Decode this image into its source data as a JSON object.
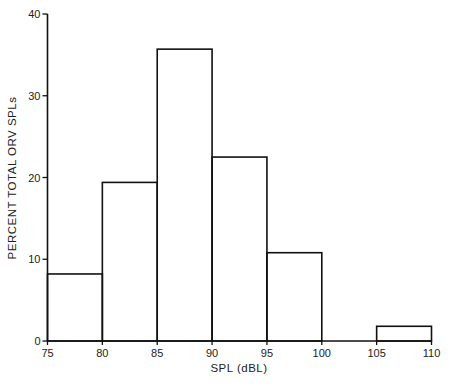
{
  "chart_data": {
    "type": "bar",
    "subtype": "histogram",
    "title": "",
    "xlabel": "SPL (dBL)",
    "ylabel": "PERCENT TOTAL ORV SPLs",
    "bins": [
      {
        "from": 75,
        "to": 80,
        "value": 8.2
      },
      {
        "from": 80,
        "to": 85,
        "value": 19.4
      },
      {
        "from": 85,
        "to": 90,
        "value": 35.7
      },
      {
        "from": 90,
        "to": 95,
        "value": 22.5
      },
      {
        "from": 95,
        "to": 100,
        "value": 10.8
      },
      {
        "from": 100,
        "to": 105,
        "value": 0
      },
      {
        "from": 105,
        "to": 110,
        "value": 1.8
      }
    ],
    "categories": [
      "75-80",
      "80-85",
      "85-90",
      "90-95",
      "95-100",
      "100-105",
      "105-110"
    ],
    "values": [
      8.2,
      19.4,
      35.7,
      22.5,
      10.8,
      0,
      1.8
    ],
    "x_ticks": [
      75,
      80,
      85,
      90,
      95,
      100,
      105,
      110
    ],
    "y_ticks": [
      0,
      10,
      20,
      30,
      40
    ],
    "xlim": [
      75,
      110
    ],
    "ylim": [
      0,
      40
    ],
    "grid": false,
    "legend": null
  },
  "labels": {
    "xlabel": "SPL (dBL)",
    "ylabel": "PERCENT TOTAL ORV SPLs"
  }
}
